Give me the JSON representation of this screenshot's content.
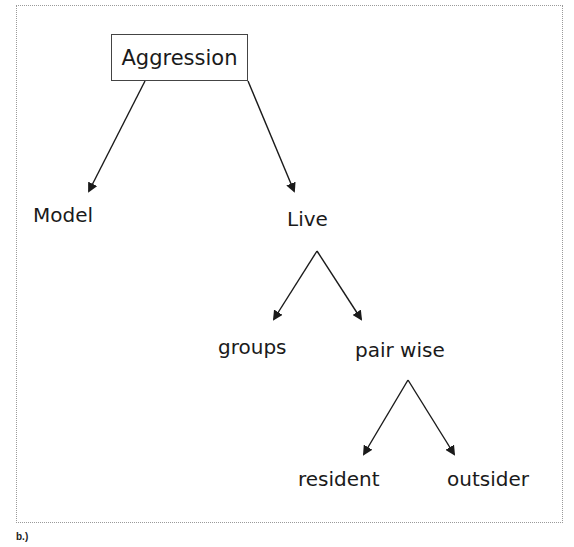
{
  "diagram": {
    "type": "tree",
    "root": {
      "label": "Aggression",
      "boxed": true
    },
    "nodes": {
      "model": {
        "label": "Model"
      },
      "live": {
        "label": "Live"
      },
      "groups": {
        "label": "groups"
      },
      "pair_wise": {
        "label": "pair wise"
      },
      "resident": {
        "label": "resident"
      },
      "outsider": {
        "label": "outsider"
      }
    },
    "edges": [
      {
        "from": "Aggression",
        "to": "Model"
      },
      {
        "from": "Aggression",
        "to": "Live"
      },
      {
        "from": "Live",
        "to": "groups"
      },
      {
        "from": "Live",
        "to": "pair wise"
      },
      {
        "from": "pair wise",
        "to": "resident"
      },
      {
        "from": "pair wise",
        "to": "outsider"
      }
    ]
  },
  "caption": "b.)",
  "colors": {
    "line": "#1a1a1a",
    "border": "#9a9a9a",
    "background": "#ffffff"
  }
}
